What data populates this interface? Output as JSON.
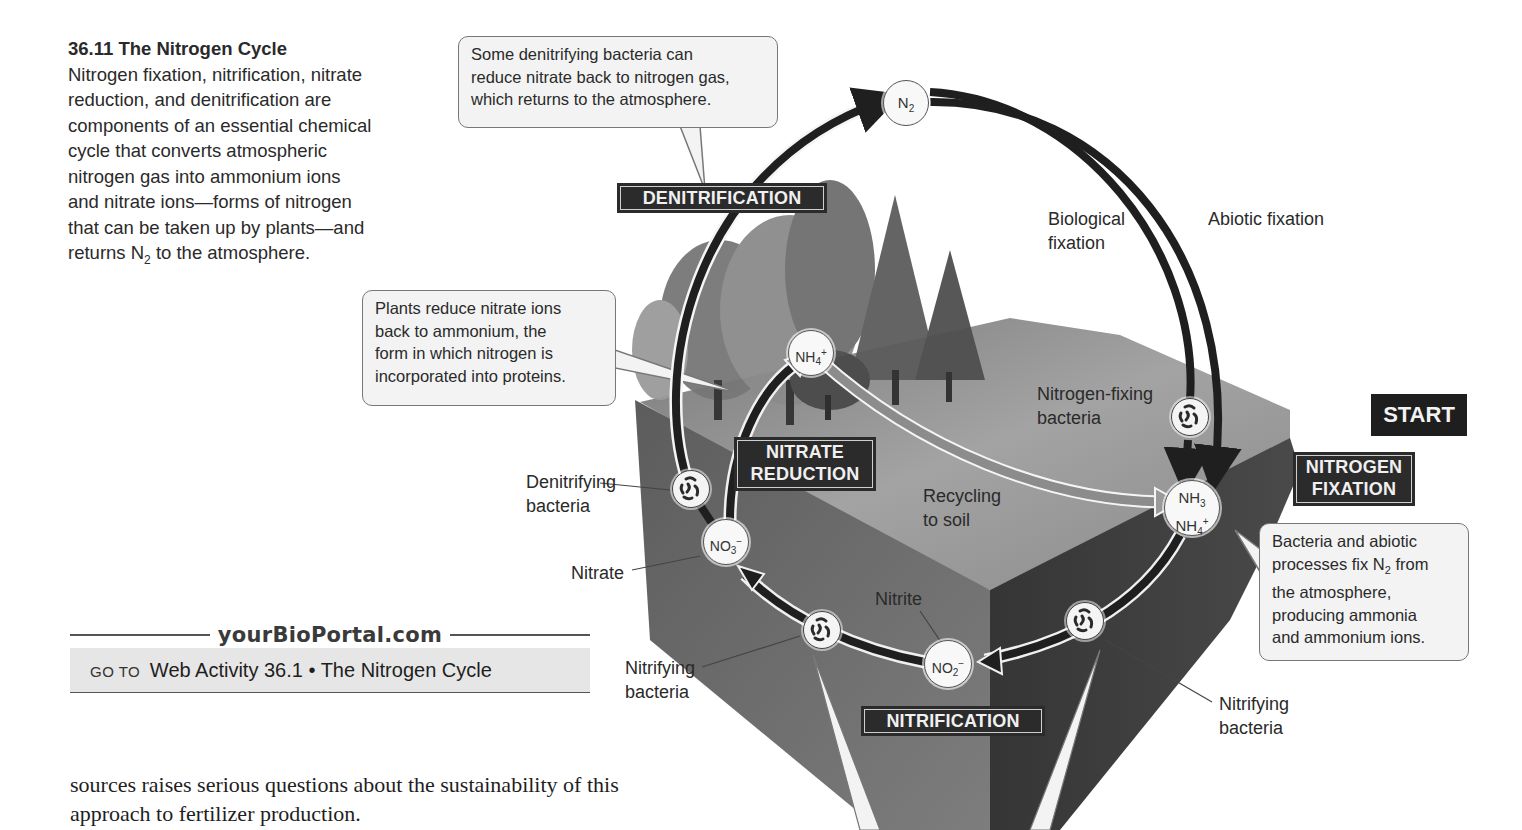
{
  "caption": {
    "title": "36.11  The Nitrogen Cycle",
    "lines": [
      "Nitrogen fixation, nitrification, nitrate",
      "reduction, and denitrification are",
      "components of an essential chemical",
      "cycle that converts atmospheric",
      "nitrogen gas into ammonium ions",
      "and nitrate ions—forms of nitrogen",
      "that can be taken up by plants—and"
    ],
    "last_line_prefix": "returns N",
    "last_line_sub": "2",
    "last_line_suffix": " to the atmosphere."
  },
  "callouts": {
    "denitrification": [
      "Some denitrifying bacteria can",
      "reduce nitrate back to nitrogen gas,",
      "which returns to the atmosphere."
    ],
    "nitrate_reduction": [
      "Plants reduce nitrate ions",
      "back to ammonium, the",
      "form in which nitrogen is",
      "incorporated into proteins."
    ],
    "fixation": {
      "line1": "Bacteria and abiotic",
      "line2_prefix": "processes fix N",
      "line2_sub": "2",
      "line2_suffix": " from",
      "line3": "the atmosphere,",
      "line4": "producing ammonia",
      "line5": "and ammonium ions."
    }
  },
  "process_labels": {
    "denitrification": "DENITRIFICATION",
    "nitrate_reduction_1": "NITRATE",
    "nitrate_reduction_2": "REDUCTION",
    "nitrogen_fixation_1": "NITROGEN",
    "nitrogen_fixation_2": "FIXATION",
    "nitrification": "NITRIFICATION",
    "start": "START"
  },
  "labels": {
    "biological_fixation_1": "Biological",
    "biological_fixation_2": "fixation",
    "abiotic_fixation": "Abiotic fixation",
    "nitrogen_fixing_bacteria_1": "Nitrogen-fixing",
    "nitrogen_fixing_bacteria_2": "bacteria",
    "denitrifying_bacteria_1": "Denitrifying",
    "denitrifying_bacteria_2": "bacteria",
    "nitrate": "Nitrate",
    "recycling_1": "Recycling",
    "recycling_2": "to soil",
    "nitrite": "Nitrite",
    "nitrifying_bacteria_left_1": "Nitrifying",
    "nitrifying_bacteria_left_2": "bacteria",
    "nitrifying_bacteria_right_1": "Nitrifying",
    "nitrifying_bacteria_right_2": "bacteria"
  },
  "nodes": {
    "n2": {
      "base": "N",
      "sub": "2"
    },
    "nh4_plant": {
      "base": "NH",
      "sub": "4",
      "sup": "+"
    },
    "nh3_soil": {
      "base1": "NH",
      "sub1": "3",
      "base2": "NH",
      "sub2": "4",
      "sup2": "+"
    },
    "no3": {
      "base": "NO",
      "sub": "3",
      "sup": "−"
    },
    "no2": {
      "base": "NO",
      "sub": "2",
      "sup": "−"
    }
  },
  "portal": {
    "site": "yourBioPortal.com",
    "goto": "GO TO",
    "activity": "Web Activity 36.1 • The Nitrogen Cycle"
  },
  "body_text": {
    "line1": "sources raises serious questions about the sustainability of this",
    "line2": "approach to fertilizer production."
  },
  "colors": {
    "arrow_dark": "#1f1f1f",
    "process_label_bg": "#2b2b2b",
    "soil_top": "#8f8f8f",
    "soil_front_left": "#6a6a6a",
    "soil_front_right": "#3f3f3f",
    "callout_bg": "#f3f3f3"
  }
}
